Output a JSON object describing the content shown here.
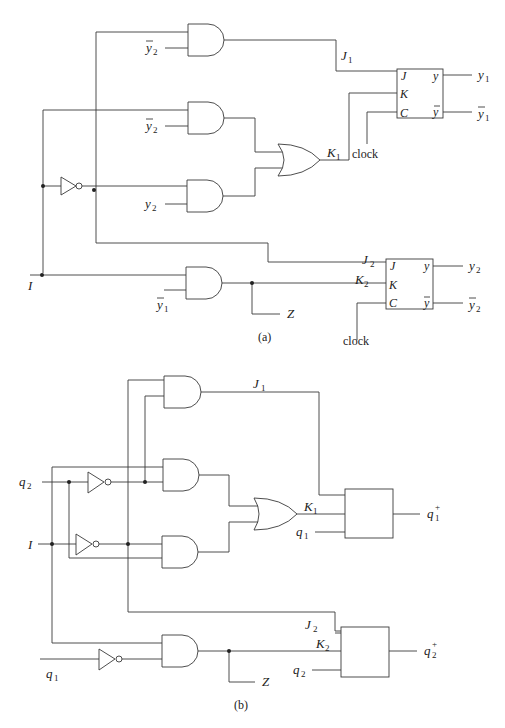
{
  "figure_a": {
    "caption": "(a)",
    "inputs": {
      "i_label": "I",
      "y2bar_top": {
        "base": "y",
        "sub": "2",
        "bar": true
      },
      "y2bar_mid": {
        "base": "y",
        "sub": "2",
        "bar": true
      },
      "y2": {
        "base": "y",
        "sub": "2"
      },
      "y1bar": {
        "base": "y",
        "sub": "1",
        "bar": true
      }
    },
    "signals": {
      "j1": {
        "base": "J",
        "sub": "1"
      },
      "k1": {
        "base": "K",
        "sub": "1"
      },
      "j2": {
        "base": "J",
        "sub": "2"
      },
      "k2": {
        "base": "K",
        "sub": "2"
      },
      "z": "Z",
      "clock_1": "clock",
      "clock_2": "clock"
    },
    "flipflop_1": {
      "pins_in": [
        "J",
        "K",
        "C"
      ],
      "pin_out_q": "y",
      "pin_out_qbar": "y",
      "out_q": {
        "base": "y",
        "sub": "1"
      },
      "out_qbar": {
        "base": "y",
        "sub": "1",
        "bar": true
      }
    },
    "flipflop_2": {
      "pins_in": [
        "J",
        "K",
        "C"
      ],
      "pin_out_q": "y",
      "pin_out_qbar": "y",
      "out_q": {
        "base": "y",
        "sub": "2"
      },
      "out_qbar": {
        "base": "y",
        "sub": "2",
        "bar": true
      }
    }
  },
  "figure_b": {
    "caption": "(b)",
    "inputs": {
      "q2": {
        "base": "q",
        "sub": "2"
      },
      "i_label": "I",
      "q1": {
        "base": "q",
        "sub": "1"
      }
    },
    "signals": {
      "j1": {
        "base": "J",
        "sub": "1"
      },
      "k1": {
        "base": "K",
        "sub": "1"
      },
      "j2": {
        "base": "J",
        "sub": "2"
      },
      "k2": {
        "base": "K",
        "sub": "2"
      },
      "z": "Z",
      "q1_in": {
        "base": "q",
        "sub": "1"
      },
      "q2_in": {
        "base": "q",
        "sub": "2"
      }
    },
    "block_1_out": {
      "base": "q",
      "sub": "1",
      "sup": "+"
    },
    "block_2_out": {
      "base": "q",
      "sub": "2",
      "sup": "+"
    }
  }
}
